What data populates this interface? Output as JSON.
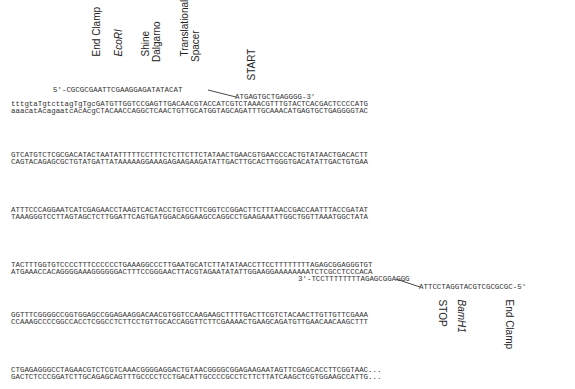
{
  "top_labels": [
    {
      "text": "End Clamp",
      "italic": false
    },
    {
      "text": "EcoRI",
      "italic": true
    },
    {
      "text": "Shine\nDalgarno",
      "italic": false
    },
    {
      "text": "Translational\nSpacer",
      "italic": false
    },
    {
      "text": "START",
      "italic": false
    }
  ],
  "bottom_labels": [
    {
      "text": "STOP",
      "italic": false
    },
    {
      "text": "BamH1",
      "italic": true
    },
    {
      "text": "End Clamp",
      "italic": false
    }
  ],
  "primers": {
    "forward_left": "5'-CGCGCGAATTCGAAGGAGATATACAT",
    "forward_right": "ATGAGTGCTGAGGGG-3'",
    "reverse_left": "3'-TCCTTTTTTTTAGAGCGGAGGG",
    "reverse_right": "ATTCCTAGGTACGTCGCGCGC-5'"
  },
  "blocks": [
    {
      "top": "tttgtaTgtcttagTgTgcGATGTTGGTCCGAGTTGACAACGTACCATCGTCTAAACGTTTGTACTCACGACTCCCCATG",
      "bottom": "aaacatAcagaatcAcAcgCTACAACCAGGCTCAACTGTTGCATGGTAGCAGATTTGCAAACATGAGTGCTGAGGGGTAC"
    },
    {
      "top": "GTCATGTCTCGCGACATACTAATATTTTTCCTTTCTCTTCTTCTATAACTGAACGTGAACCCACTGTATAACTGACACTT",
      "bottom": "CAGTACAGAGCGCTGTATGATTATAAAAAGGAAAGAGAAGAAGATATTGACTTGCACTTGGGTGACATATTGACTGTGAA"
    },
    {
      "top": "ATTTCCCAGGAATCATCGAGAACCTAAGTCACTACCTGTCCTTCGGTCCGGACTTCTTTAACCGACCAATTTACCGATAT",
      "bottom": "TAAAGGGTCCTTAGTAGCTCTTGGATTCAGTGATGGACAGGAAGCCAGGCCTGAAGAAATTGGCTGGTTAAATGGCTATA"
    },
    {
      "top": "TACTTTGGTGTCCCCTTTCCCCCCTGAAAGGCCCTTGAATGCATCTTATATAACCTTCCTTTTTTTTAGAGCGGAGGGTGT",
      "bottom": "ATGAAACCACAGGGGAAAGGGGGGACTTTCCGGGAACTTACGTAGAATATATTGGAAGGAAAAAAAATCTCGCCTCCCACA"
    },
    {
      "top": "GGTTTCGGGGCCGGTGGAGCCGGAGAAGGACAACGTGGTCCAAGAAGCTTTTGACTTCGTCTACAACTTGTTGTTCGAAA",
      "bottom": "CCAAAGCCCCGGCCACCTCGGCCTCTTCCTGTTGCACCAGGTTCTTCGAAAACTGAAGCAGATGTTGAACAACAAGCTTT"
    },
    {
      "top": "CTGAGAGGGCCTAGAACGTCTCGTCAAACGGGGAGGACTGTAACGGGGCGGAGAAGAATAGTTCGAGCACCTTCGGTAAC...",
      "bottom": "GACTCTCCCGGATCTTGCAGAGCAGTTTGCCCCTCCTGACATTGCCCCGCCTCTTCTTATCAAGCTCGTGGAAGCCATTG..."
    }
  ],
  "colors": {
    "background": "#ffffff",
    "sequence_text": "#333333",
    "label_text": "#222222",
    "connector_line": "#333333"
  }
}
